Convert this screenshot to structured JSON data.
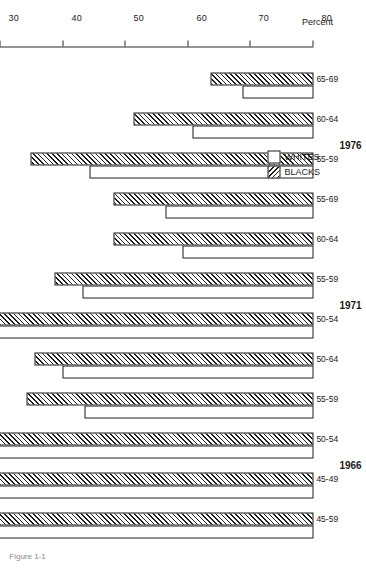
{
  "figure": {
    "caption": "Figure 1-1",
    "orientation": "rotated-90"
  },
  "axis": {
    "title": "Percent",
    "ticks": [
      "80",
      "70",
      "60",
      "50",
      "40",
      "30",
      "20",
      "10",
      "0"
    ],
    "min": 0,
    "max": 80
  },
  "legend": {
    "items": [
      {
        "label": "WHITES",
        "pattern": "solid-white"
      },
      {
        "label": "BLACKS",
        "pattern": "diagonal-hatch"
      }
    ]
  },
  "chart_data": {
    "type": "bar",
    "orientation": "horizontal",
    "title": "",
    "xlabel": "",
    "ylabel": "Percent",
    "ylim": [
      0,
      80
    ],
    "grid": false,
    "legend_position": "middle-left",
    "groups": [
      "1976",
      "1971",
      "1966"
    ],
    "categories": [
      "65-69",
      "60-64",
      "55-59",
      "55-69",
      "60-64",
      "55-59",
      "50-54",
      "50-64",
      "55-59",
      "50-54",
      "45-49",
      "45-59"
    ],
    "group_of_category": [
      "1976",
      "1976",
      "1976",
      "1976",
      "1971",
      "1971",
      "1971",
      "1971",
      "1966",
      "1966",
      "1966",
      "1966"
    ],
    "series": [
      {
        "name": "BLACKS",
        "values": [
          16.4,
          28.8,
          45.3,
          32.0,
          32.0,
          41.5,
          56.0,
          44.6,
          45.9,
          57.3,
          66.8,
          58.0
        ]
      },
      {
        "name": "WHITES",
        "values": [
          11.4,
          19.3,
          35.8,
          23.7,
          20.9,
          37.0,
          57.3,
          40.2,
          36.7,
          57.3,
          73.0,
          58.0
        ]
      }
    ]
  }
}
